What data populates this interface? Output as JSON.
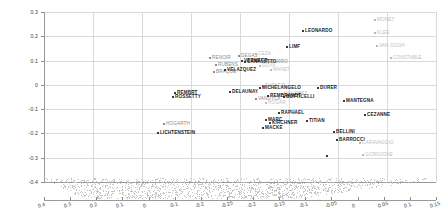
{
  "chart_data": {
    "type": "scatter",
    "title": "",
    "xlabel": "",
    "ylabel": "",
    "xlim": [
      0.45,
      -0.3
    ],
    "ylim": [
      -0.4,
      0.32
    ],
    "grid": true,
    "legend": "none",
    "projection": "3d",
    "x_ticks_upper": [
      "0.4",
      "0.3",
      "0.2",
      "0.1",
      "0",
      "-0.1",
      "-0.2",
      "-0.3",
      "-0.4"
    ],
    "x_ticks": [
      "0.4",
      "0.3",
      "0.2",
      "0.1",
      "0",
      "-0.1",
      "-0.2",
      "-0.25",
      "-0.2",
      "-0.15",
      "-0.1",
      "-0.05",
      "0",
      "0.05",
      "0.1",
      "0.15"
    ],
    "y_ticks": [
      "0.3",
      "0.2",
      "0.1",
      "0",
      "-0.1",
      "-0.2",
      "-0.3",
      "-0.4"
    ],
    "points": [
      {
        "label": "LEONARDO",
        "x": 310,
        "y": 31,
        "px": 302,
        "py": 30,
        "tone": "dark"
      },
      {
        "label": "MONET",
        "x": 379,
        "y": 20,
        "px": 374,
        "py": 19,
        "tone": "faint"
      },
      {
        "label": "KLEE",
        "x": 379,
        "y": 33,
        "px": 374,
        "py": 32,
        "tone": "faint"
      },
      {
        "label": "VAN GOGH",
        "x": 381,
        "y": 46,
        "px": 376,
        "py": 45,
        "tone": "faint"
      },
      {
        "label": "LIMF",
        "x": 291,
        "y": 47,
        "px": 286,
        "py": 46,
        "tone": "dark"
      },
      {
        "label": "CONSTABLE",
        "x": 396,
        "y": 58,
        "px": 390,
        "py": 57,
        "tone": "faint"
      },
      {
        "label": "DEGAS",
        "x": 243,
        "y": 56,
        "px": 238,
        "py": 55,
        "tone": "mid"
      },
      {
        "label": "CEZA",
        "x": 259,
        "y": 54,
        "px": 255,
        "py": 53,
        "tone": "faint"
      },
      {
        "label": "RENOIR",
        "x": 213,
        "y": 58,
        "px": 209,
        "py": 57,
        "tone": "mid"
      },
      {
        "label": "VERMEER",
        "x": 246,
        "y": 60,
        "px": 241,
        "py": 60,
        "tone": "dark"
      },
      {
        "label": "CANALETTO",
        "x": 249,
        "y": 62,
        "px": 244,
        "py": 61,
        "tone": "dark"
      },
      {
        "label": "PISSARRO",
        "x": 265,
        "y": 62,
        "px": 260,
        "py": 61,
        "tone": "mid"
      },
      {
        "label": "RUBENS",
        "x": 219,
        "y": 65,
        "px": 215,
        "py": 64,
        "tone": "mid"
      },
      {
        "label": "GOYA",
        "x": 264,
        "y": 66,
        "px": 259,
        "py": 65,
        "tone": "faint"
      },
      {
        "label": "BRAQUE",
        "x": 217,
        "y": 72,
        "px": 213,
        "py": 71,
        "tone": "mid"
      },
      {
        "label": "VELAZQUEZ",
        "x": 228,
        "y": 70,
        "px": 224,
        "py": 69,
        "tone": "dark"
      },
      {
        "label": "MANET",
        "x": 275,
        "y": 70,
        "px": 270,
        "py": 69,
        "tone": "faint"
      },
      {
        "label": "TURNER",
        "x": 266,
        "y": 86,
        "px": 262,
        "py": 85,
        "tone": "faint"
      },
      {
        "label": "MICHELANGELO",
        "x": 264,
        "y": 88,
        "px": 259,
        "py": 87,
        "tone": "dark"
      },
      {
        "label": "DURER",
        "x": 322,
        "y": 88,
        "px": 317,
        "py": 87,
        "tone": "dark"
      },
      {
        "label": "DELAUNAY",
        "x": 233,
        "y": 92,
        "px": 229,
        "py": 91,
        "tone": "dark"
      },
      {
        "label": "BOTTICELLI",
        "x": 288,
        "y": 97,
        "px": 283,
        "py": 96,
        "tone": "dark"
      },
      {
        "label": "COURBET",
        "x": 285,
        "y": 94,
        "px": 281,
        "py": 93,
        "tone": "faint"
      },
      {
        "label": "VANDYCK",
        "x": 260,
        "y": 99,
        "px": 255,
        "py": 98,
        "tone": "mid"
      },
      {
        "label": "REMBRANDT",
        "x": 272,
        "y": 96,
        "px": 267,
        "py": 95,
        "tone": "dark"
      },
      {
        "label": "HOGAR",
        "x": 270,
        "y": 103,
        "px": 265,
        "py": 102,
        "tone": "faint"
      },
      {
        "label": "MANTEGNA",
        "x": 348,
        "y": 101,
        "px": 343,
        "py": 100,
        "tone": "dark"
      },
      {
        "label": "RAPHAEL",
        "x": 283,
        "y": 113,
        "px": 278,
        "py": 112,
        "tone": "dark"
      },
      {
        "label": "TITIAN",
        "x": 310,
        "y": 121,
        "px": 306,
        "py": 120,
        "tone": "dark"
      },
      {
        "label": "CEZANNE",
        "x": 369,
        "y": 115,
        "px": 364,
        "py": 114,
        "tone": "dark"
      },
      {
        "label": "MARC",
        "x": 269,
        "y": 120,
        "px": 265,
        "py": 119,
        "tone": "dark"
      },
      {
        "label": "KIRCHNER",
        "x": 274,
        "y": 123,
        "px": 269,
        "py": 122,
        "tone": "dark"
      },
      {
        "label": "MACKE",
        "x": 266,
        "y": 128,
        "px": 262,
        "py": 127,
        "tone": "dark"
      },
      {
        "label": "BELLINI",
        "x": 337,
        "y": 132,
        "px": 333,
        "py": 131,
        "tone": "dark"
      },
      {
        "label": "BARROCCI",
        "x": 340,
        "y": 140,
        "px": 336,
        "py": 139,
        "tone": "dark"
      },
      {
        "label": "CARAVAGGIO",
        "x": 364,
        "y": 143,
        "px": 359,
        "py": 142,
        "tone": "faint"
      },
      {
        "label": "GIORGIONE",
        "x": 367,
        "y": 155,
        "px": 362,
        "py": 154,
        "tone": "faint"
      },
      {
        "label": "UNLABELED1",
        "x": 0,
        "y": 0,
        "px": 326,
        "py": 155,
        "tone": "dark"
      },
      {
        "label": "LICHTENSTEIN",
        "x": 161,
        "y": 133,
        "px": 157,
        "py": 132,
        "tone": "dark"
      },
      {
        "label": "HOGARTH",
        "x": 167,
        "y": 124,
        "px": 163,
        "py": 123,
        "tone": "mid"
      },
      {
        "label": "REMBRT",
        "x": 178,
        "y": 93,
        "px": 174,
        "py": 92,
        "tone": "dark"
      },
      {
        "label": "ROSSETTY",
        "x": 176,
        "y": 97,
        "px": 172,
        "py": 96,
        "tone": "dark"
      }
    ]
  }
}
